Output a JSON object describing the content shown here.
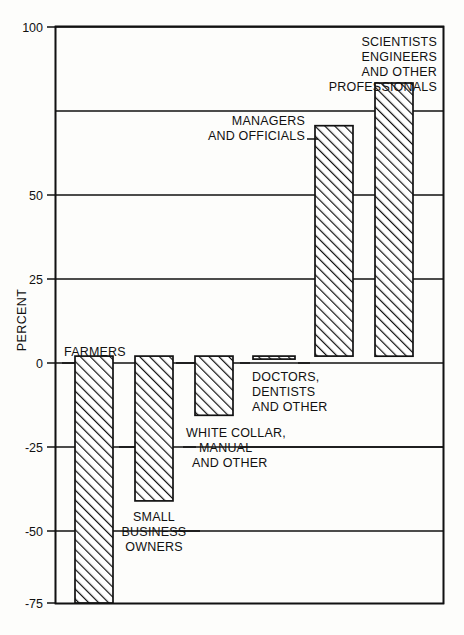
{
  "chart_data": {
    "type": "bar",
    "title": "",
    "subtitle": "",
    "xlabel": "",
    "ylabel": "PERCENT",
    "ylim": [
      -75,
      100
    ],
    "yticks": [
      100,
      75,
      50,
      25,
      0,
      -25,
      -50,
      -75
    ],
    "ytick_labels": [
      "100",
      "",
      "50",
      "25",
      "0",
      "-25",
      "-50",
      "-75"
    ],
    "grid": true,
    "grid_axis": "y",
    "legend": "none",
    "orientation": "vertical",
    "bar_fill": "diagonal-hatch",
    "bar_edge_color": "#111111",
    "background_color": "#fdfdfb",
    "categories": [
      "FARMERS",
      "SMALL BUSINESS OWNERS",
      "WHITE COLLAR, MANUAL AND OTHER",
      "DOCTORS, DENTISTS AND OTHER",
      "MANAGERS AND OFFICIALS",
      "SCIENTISTS ENGINEERS AND OTHER PROFESSIONALS"
    ],
    "values": [
      -75,
      -44,
      -18,
      0,
      70,
      83
    ]
  },
  "axis": {
    "y_title": "PERCENT",
    "ticks": [
      {
        "value": 100,
        "label": "100"
      },
      {
        "value": 75,
        "label": ""
      },
      {
        "value": 50,
        "label": "50"
      },
      {
        "value": 25,
        "label": "25"
      },
      {
        "value": 0,
        "label": "0"
      },
      {
        "value": -25,
        "label": "-25"
      },
      {
        "value": -50,
        "label": "-50"
      },
      {
        "value": -75,
        "label": "-75"
      }
    ]
  },
  "bars": [
    {
      "id": "farmers",
      "value": -75,
      "label_lines": [
        "FARMERS"
      ]
    },
    {
      "id": "small-business-owners",
      "value": -44,
      "label_lines": [
        "SMALL",
        "BUSINESS",
        "OWNERS"
      ]
    },
    {
      "id": "white-collar-manual-and-other",
      "value": -18,
      "label_lines": [
        "WHITE COLLAR,",
        "MANUAL",
        "AND OTHER"
      ]
    },
    {
      "id": "doctors-dentists-and-other",
      "value": 0,
      "label_lines": [
        "DOCTORS,",
        "DENTISTS",
        "AND OTHER"
      ]
    },
    {
      "id": "managers-and-officials",
      "value": 70,
      "label_lines": [
        "MANAGERS",
        "AND OFFICIALS"
      ]
    },
    {
      "id": "scientists-engineers-and-other-professionals",
      "value": 83,
      "label_lines": [
        "SCIENTISTS",
        "ENGINEERS",
        "AND OTHER",
        "PROFESSIONALS"
      ]
    }
  ]
}
